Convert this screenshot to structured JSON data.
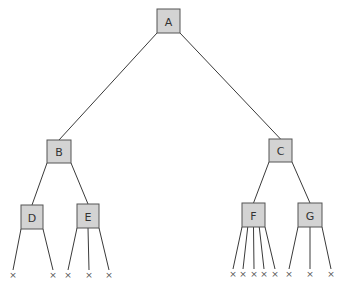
{
  "diagram": {
    "type": "tree",
    "node_fill": "#d3d3d3",
    "node_stroke": "#555555",
    "edge_color": "#3a3a3a",
    "nodes": [
      {
        "id": "A",
        "label": "A",
        "x": 157,
        "y": 9,
        "w": 23,
        "h": 24
      },
      {
        "id": "B",
        "label": "B",
        "x": 47,
        "y": 140,
        "w": 24,
        "h": 23
      },
      {
        "id": "C",
        "label": "C",
        "x": 269,
        "y": 139,
        "w": 23,
        "h": 23
      },
      {
        "id": "D",
        "label": "D",
        "x": 21,
        "y": 205,
        "w": 22,
        "h": 24
      },
      {
        "id": "E",
        "label": "E",
        "x": 77,
        "y": 204,
        "w": 22,
        "h": 24
      },
      {
        "id": "F",
        "label": "F",
        "x": 242,
        "y": 203,
        "w": 23,
        "h": 24
      },
      {
        "id": "G",
        "label": "G",
        "x": 298,
        "y": 203,
        "w": 24,
        "h": 24
      }
    ],
    "edges": [
      {
        "from": "A",
        "to": "B"
      },
      {
        "from": "A",
        "to": "C"
      },
      {
        "from": "B",
        "to": "D"
      },
      {
        "from": "B",
        "to": "E"
      },
      {
        "from": "C",
        "to": "F"
      },
      {
        "from": "C",
        "to": "G"
      }
    ],
    "leaf_symbol": "×",
    "leaves": [
      {
        "parent": "D",
        "x": 13,
        "y": 275
      },
      {
        "parent": "D",
        "x": 53,
        "y": 275
      },
      {
        "parent": "E",
        "x": 68,
        "y": 275
      },
      {
        "parent": "E",
        "x": 89,
        "y": 275
      },
      {
        "parent": "E",
        "x": 109,
        "y": 275
      },
      {
        "parent": "F",
        "x": 233,
        "y": 274
      },
      {
        "parent": "F",
        "x": 243,
        "y": 274
      },
      {
        "parent": "F",
        "x": 254,
        "y": 274
      },
      {
        "parent": "F",
        "x": 264,
        "y": 274
      },
      {
        "parent": "F",
        "x": 275,
        "y": 274
      },
      {
        "parent": "G",
        "x": 289,
        "y": 274
      },
      {
        "parent": "G",
        "x": 310,
        "y": 274
      },
      {
        "parent": "G",
        "x": 331,
        "y": 274
      }
    ]
  }
}
